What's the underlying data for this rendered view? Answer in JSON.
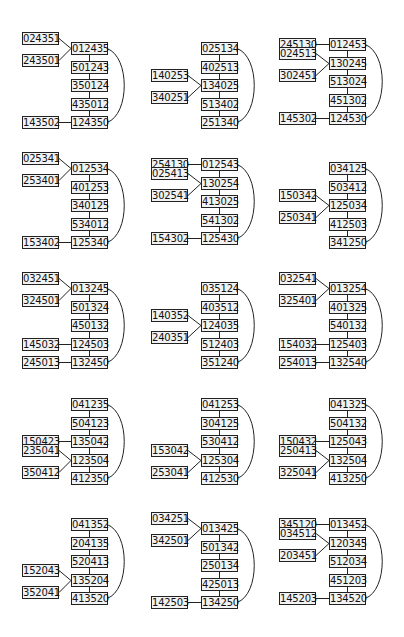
{
  "diagrams": [
    {
      "chain": [
        "012435",
        "501243",
        "350124",
        "435012",
        "124350"
      ],
      "left": [
        {
          "label": "024351",
          "to": 0,
          "slot": "upper"
        },
        {
          "label": "243501",
          "to": 0,
          "slot": "lower"
        },
        {
          "label": "143502",
          "to": 4,
          "slot": "same"
        }
      ],
      "top_row": 1
    },
    {
      "chain": [
        "025134",
        "402513",
        "134025",
        "513402",
        "251340"
      ],
      "left": [
        {
          "label": "140253",
          "to": 2,
          "slot": "upper"
        },
        {
          "label": "340251",
          "to": 2,
          "slot": "lower"
        }
      ],
      "top_row": 1
    },
    {
      "chain": [
        "012453",
        "130245",
        "513024",
        "451302",
        "124530"
      ],
      "left": [
        {
          "label": "245130",
          "to": 0,
          "slot": "same"
        },
        {
          "label": "024513",
          "to": 1,
          "slot": "upper"
        },
        {
          "label": "302451",
          "to": 1,
          "slot": "lower"
        },
        {
          "label": "145302",
          "to": 4,
          "slot": "same"
        }
      ],
      "top_row": 0
    },
    {
      "chain": [
        "012534",
        "401253",
        "340125",
        "534012",
        "125340"
      ],
      "left": [
        {
          "label": "025341",
          "to": 0,
          "slot": "upper"
        },
        {
          "label": "253401",
          "to": 0,
          "slot": "lower"
        },
        {
          "label": "153402",
          "to": 4,
          "slot": "same"
        }
      ],
      "top_row": 1
    },
    {
      "chain": [
        "012543",
        "130254",
        "413025",
        "541302",
        "125430"
      ],
      "left": [
        {
          "label": "254130",
          "to": 0,
          "slot": "same"
        },
        {
          "label": "025413",
          "to": 1,
          "slot": "upper"
        },
        {
          "label": "302541",
          "to": 1,
          "slot": "lower"
        },
        {
          "label": "154302",
          "to": 4,
          "slot": "same"
        }
      ],
      "top_row": 0
    },
    {
      "chain": [
        "034125",
        "503412",
        "125034",
        "412503",
        "341250"
      ],
      "left": [
        {
          "label": "150342",
          "to": 2,
          "slot": "upper"
        },
        {
          "label": "250341",
          "to": 2,
          "slot": "lower"
        }
      ],
      "top_row": 1
    },
    {
      "chain": [
        "013245",
        "501324",
        "450132",
        "124503",
        "132450"
      ],
      "left": [
        {
          "label": "032451",
          "to": 0,
          "slot": "upper"
        },
        {
          "label": "324501",
          "to": 0,
          "slot": "lower"
        },
        {
          "label": "145032",
          "to": 3,
          "slot": "same"
        },
        {
          "label": "245013",
          "to": 4,
          "slot": "same"
        }
      ],
      "top_row": 1
    },
    {
      "chain": [
        "035124",
        "403512",
        "124035",
        "512403",
        "351240"
      ],
      "left": [
        {
          "label": "140352",
          "to": 2,
          "slot": "upper"
        },
        {
          "label": "240351",
          "to": 2,
          "slot": "lower"
        }
      ],
      "top_row": 1
    },
    {
      "chain": [
        "013254",
        "401325",
        "540132",
        "125403",
        "132540"
      ],
      "left": [
        {
          "label": "032541",
          "to": 0,
          "slot": "upper"
        },
        {
          "label": "325401",
          "to": 0,
          "slot": "lower"
        },
        {
          "label": "154032",
          "to": 3,
          "slot": "same"
        },
        {
          "label": "254013",
          "to": 4,
          "slot": "same"
        }
      ],
      "top_row": 1
    },
    {
      "chain": [
        "041235",
        "504123",
        "135042",
        "123504",
        "412350"
      ],
      "left": [
        {
          "label": "150423",
          "to": 2,
          "slot": "same"
        },
        {
          "label": "235041",
          "to": 3,
          "slot": "upper"
        },
        {
          "label": "350412",
          "to": 3,
          "slot": "lower"
        }
      ],
      "top_row": 0
    },
    {
      "chain": [
        "041253",
        "304125",
        "530412",
        "125304",
        "412530"
      ],
      "left": [
        {
          "label": "153042",
          "to": 3,
          "slot": "upper"
        },
        {
          "label": "253041",
          "to": 3,
          "slot": "lower"
        }
      ],
      "top_row": 0
    },
    {
      "chain": [
        "041325",
        "504132",
        "125043",
        "132504",
        "413250"
      ],
      "left": [
        {
          "label": "150432",
          "to": 2,
          "slot": "same"
        },
        {
          "label": "250413",
          "to": 3,
          "slot": "upper"
        },
        {
          "label": "325041",
          "to": 3,
          "slot": "lower"
        }
      ],
      "top_row": 0
    },
    {
      "chain": [
        "041352",
        "204135",
        "520413",
        "135204",
        "413520"
      ],
      "left": [
        {
          "label": "152043",
          "to": 3,
          "slot": "upper"
        },
        {
          "label": "352041",
          "to": 3,
          "slot": "lower"
        }
      ],
      "top_row": 0
    },
    {
      "chain": [
        "013425",
        "501342",
        "250134",
        "425013",
        "134250"
      ],
      "left": [
        {
          "label": "034251",
          "to": 0,
          "slot": "upper"
        },
        {
          "label": "342501",
          "to": 0,
          "slot": "lower"
        },
        {
          "label": "142503",
          "to": 4,
          "slot": "same"
        }
      ],
      "top_row": 1
    },
    {
      "chain": [
        "013452",
        "120345",
        "512034",
        "451203",
        "134520"
      ],
      "left": [
        {
          "label": "345120",
          "to": 0,
          "slot": "same"
        },
        {
          "label": "034512",
          "to": 1,
          "slot": "upper"
        },
        {
          "label": "203451",
          "to": 1,
          "slot": "lower"
        },
        {
          "label": "145203",
          "to": 4,
          "slot": "same"
        }
      ],
      "top_row": 0
    }
  ],
  "layout": {
    "col_x": [
      71,
      201,
      329
    ],
    "left_x": [
      22,
      151,
      279
    ],
    "panel_top": [
      42,
      162,
      282,
      402,
      522
    ],
    "row_step": 18.5,
    "node_w": 37,
    "node_h": 13
  },
  "colors": {
    "stroke": "#222222",
    "node_fill": "#f2f2f2",
    "text": "#111111"
  }
}
